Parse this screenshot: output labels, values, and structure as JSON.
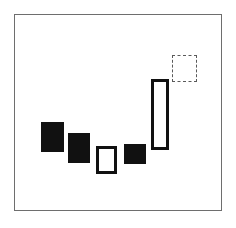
{
  "figure": {
    "title": "",
    "background_color": "#ffffff",
    "width": 236,
    "height": 228
  },
  "frame": {
    "name": "plot-frame",
    "x": 14,
    "y": 14,
    "width": 208,
    "height": 197,
    "border_width": 1,
    "border_color": "#6e6e6e",
    "fill_color": "#ffffff"
  },
  "chart_data": {
    "type": "bar",
    "title": "",
    "xlabel": "",
    "ylabel": "",
    "grid": false,
    "legend": null,
    "categories": [
      "1",
      "2",
      "3",
      "4",
      "5",
      "6"
    ],
    "values": [
      30,
      30,
      28,
      20,
      71,
      27
    ],
    "styles": [
      "filled",
      "filled",
      "outlined",
      "filled",
      "outlined",
      "dashed"
    ]
  },
  "shapes": [
    {
      "id": "shape-1",
      "name": "bar-1-filled",
      "style": "filled",
      "x": 41,
      "y": 122,
      "width": 23,
      "height": 30,
      "fill_color": "#111111",
      "stroke_color": "#111111",
      "stroke_width": 0,
      "dashed": false
    },
    {
      "id": "shape-2",
      "name": "bar-2-filled",
      "style": "filled",
      "x": 68,
      "y": 133,
      "width": 22,
      "height": 30,
      "fill_color": "#111111",
      "stroke_color": "#111111",
      "stroke_width": 0,
      "dashed": false
    },
    {
      "id": "shape-3",
      "name": "bar-3-outlined",
      "style": "outlined",
      "x": 96,
      "y": 146,
      "width": 21,
      "height": 28,
      "fill_color": "#ffffff",
      "stroke_color": "#111111",
      "stroke_width": 3,
      "dashed": false
    },
    {
      "id": "shape-4",
      "name": "bar-4-filled",
      "style": "filled",
      "x": 124,
      "y": 144,
      "width": 22,
      "height": 20,
      "fill_color": "#111111",
      "stroke_color": "#111111",
      "stroke_width": 0,
      "dashed": false
    },
    {
      "id": "shape-5",
      "name": "bar-5-outlined-tall",
      "style": "outlined",
      "x": 151,
      "y": 79,
      "width": 18,
      "height": 71,
      "fill_color": "#ffffff",
      "stroke_color": "#111111",
      "stroke_width": 3,
      "dashed": false
    },
    {
      "id": "shape-6",
      "name": "bar-6-dashed-placeholder",
      "style": "dashed",
      "x": 172,
      "y": 55,
      "width": 25,
      "height": 27,
      "fill_color": "#ffffff",
      "stroke_color": "#5a5a5a",
      "stroke_width": 1,
      "dashed": true
    }
  ]
}
